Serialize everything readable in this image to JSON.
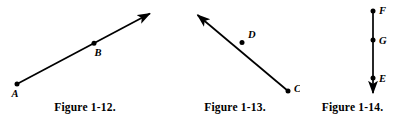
{
  "page": {
    "background_color": "#ffffff",
    "ink_color": "#000000",
    "width": 405,
    "height": 129
  },
  "figures": [
    {
      "id": "figure-1-12",
      "caption": "Figure 1-12.",
      "kind": "ray",
      "description": "Ray starting at point A rising to the right through point B with an arrowhead at the upper-right end",
      "points": [
        {
          "label": "A",
          "x": 17,
          "y": 84,
          "label_x": 15,
          "label_y": 97
        },
        {
          "label": "B",
          "x": 94,
          "y": 42,
          "label_x": 97,
          "label_y": 55
        }
      ],
      "segment": {
        "x1": 17,
        "y1": 84,
        "x2": 152,
        "y2": 12
      },
      "arrowheads": [
        "end"
      ]
    },
    {
      "id": "figure-1-13",
      "caption": "Figure 1-13.",
      "kind": "ray",
      "description": "Ray starting at point C descending from the upper-left with an arrowhead at the upper-left end, passing through point D",
      "points": [
        {
          "label": "D",
          "x": 242,
          "y": 42,
          "label_x": 247,
          "label_y": 37
        },
        {
          "label": "C",
          "x": 288,
          "y": 91,
          "label_x": 293,
          "label_y": 90
        }
      ],
      "segment": {
        "x1": 288,
        "y1": 91,
        "x2": 196,
        "y2": 13
      },
      "arrowheads": [
        "end"
      ]
    },
    {
      "id": "figure-1-14",
      "caption": "Figure 1-14.",
      "kind": "ray",
      "description": "Vertical ray starting at point F going downward through points G and E with an arrowhead at the bottom",
      "points": [
        {
          "label": "F",
          "x": 373,
          "y": 11,
          "label_x": 379,
          "label_y": 10
        },
        {
          "label": "G",
          "x": 373,
          "y": 40,
          "label_x": 379,
          "label_y": 40
        },
        {
          "label": "E",
          "x": 373,
          "y": 78,
          "label_x": 379,
          "label_y": 78
        }
      ],
      "segment": {
        "x1": 373,
        "y1": 11,
        "x2": 373,
        "y2": 97
      },
      "arrowheads": [
        "end"
      ]
    }
  ]
}
